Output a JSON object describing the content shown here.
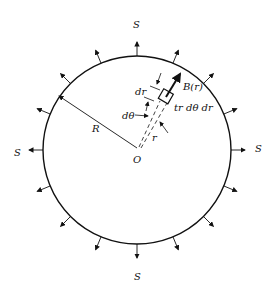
{
  "diagram": {
    "type": "circular plate with radial outward surface arrows",
    "circle": {
      "cx": 137,
      "cy": 150,
      "r": 94,
      "stroke": "#111111"
    },
    "arrow_count": 16,
    "labels": {
      "S_top": "S",
      "S_bottom": "S",
      "S_left": "S",
      "S_right": "S",
      "R": "R",
      "O": "O",
      "dr": "dr",
      "dtheta": "dθ",
      "B": "B(r)",
      "element": "tr dθ dr",
      "r": "r"
    }
  }
}
